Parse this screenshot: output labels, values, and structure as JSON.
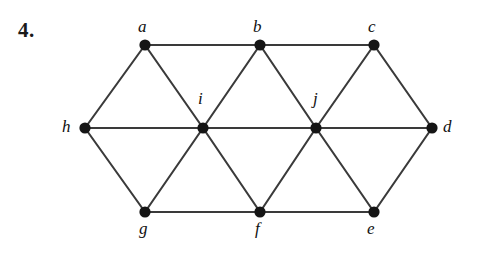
{
  "figure": {
    "problem_number": "4.",
    "background_color": "#ffffff",
    "edge_color": "#3a3a3a",
    "vertex_color": "#151515",
    "label_color": "#111111",
    "width": 479,
    "height": 258
  },
  "graph": {
    "vertices": [
      {
        "id": "a",
        "label": "a",
        "x": 145,
        "y": 45,
        "label_x": 138,
        "label_y": 18
      },
      {
        "id": "b",
        "label": "b",
        "x": 260,
        "y": 45,
        "label_x": 253,
        "label_y": 18
      },
      {
        "id": "c",
        "label": "c",
        "x": 374,
        "y": 45,
        "label_x": 368,
        "label_y": 18
      },
      {
        "id": "d",
        "label": "d",
        "x": 432,
        "y": 128,
        "label_x": 443,
        "label_y": 118
      },
      {
        "id": "e",
        "label": "e",
        "x": 374,
        "y": 212,
        "label_x": 367,
        "label_y": 220
      },
      {
        "id": "f",
        "label": "f",
        "x": 260,
        "y": 212,
        "label_x": 255,
        "label_y": 220
      },
      {
        "id": "g",
        "label": "g",
        "x": 145,
        "y": 212,
        "label_x": 139,
        "label_y": 220
      },
      {
        "id": "h",
        "label": "h",
        "x": 85,
        "y": 128,
        "label_x": 62,
        "label_y": 118
      },
      {
        "id": "i",
        "label": "i",
        "x": 203,
        "y": 128,
        "label_x": 198,
        "label_y": 90
      },
      {
        "id": "j",
        "label": "j",
        "x": 316,
        "y": 128,
        "label_x": 313,
        "label_y": 90
      }
    ],
    "edges": [
      {
        "from": "a",
        "to": "b"
      },
      {
        "from": "b",
        "to": "c"
      },
      {
        "from": "c",
        "to": "d"
      },
      {
        "from": "d",
        "to": "e"
      },
      {
        "from": "e",
        "to": "f"
      },
      {
        "from": "f",
        "to": "g"
      },
      {
        "from": "g",
        "to": "h"
      },
      {
        "from": "h",
        "to": "a"
      },
      {
        "from": "h",
        "to": "i"
      },
      {
        "from": "i",
        "to": "j"
      },
      {
        "from": "j",
        "to": "d"
      },
      {
        "from": "a",
        "to": "i"
      },
      {
        "from": "b",
        "to": "i"
      },
      {
        "from": "b",
        "to": "j"
      },
      {
        "from": "c",
        "to": "j"
      },
      {
        "from": "g",
        "to": "i"
      },
      {
        "from": "f",
        "to": "i"
      },
      {
        "from": "f",
        "to": "j"
      },
      {
        "from": "e",
        "to": "j"
      }
    ],
    "vertex_radius": 5.6
  }
}
